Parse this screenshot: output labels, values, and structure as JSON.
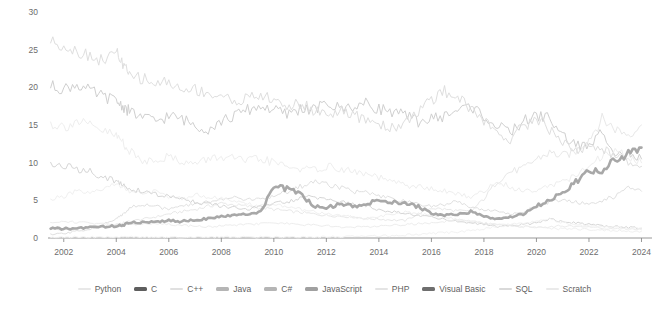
{
  "chart_data": {
    "type": "line",
    "title": "",
    "subtitle": "",
    "xlabel": "",
    "ylabel": "",
    "xlim": [
      2001.4,
      2024.4
    ],
    "ylim": [
      0,
      30
    ],
    "grid": false,
    "legend_position": "bottom",
    "highlight_series": "JavaScript",
    "x_ticks": [
      "2002",
      "2004",
      "2006",
      "2008",
      "2010",
      "2012",
      "2014",
      "2016",
      "2018",
      "2020",
      "2022",
      "2024"
    ],
    "x_tick_values": [
      2002,
      2004,
      2006,
      2008,
      2010,
      2012,
      2014,
      2016,
      2018,
      2020,
      2022,
      2024
    ],
    "y_ticks": [
      "0",
      "5",
      "10",
      "15",
      "20",
      "25",
      "30"
    ],
    "y_tick_values": [
      0,
      5,
      10,
      15,
      20,
      25,
      30
    ],
    "x": [
      2001.5,
      2002.0,
      2002.5,
      2003.0,
      2003.5,
      2004.0,
      2004.25,
      2004.5,
      2005.0,
      2005.5,
      2006.0,
      2006.5,
      2007.0,
      2007.5,
      2008.0,
      2008.5,
      2009.0,
      2009.5,
      2010.0,
      2010.5,
      2011.0,
      2011.5,
      2012.0,
      2012.5,
      2013.0,
      2013.5,
      2014.0,
      2014.5,
      2015.0,
      2015.5,
      2016.0,
      2016.5,
      2017.0,
      2017.5,
      2018.0,
      2018.5,
      2019.0,
      2019.5,
      2020.0,
      2020.5,
      2021.0,
      2021.5,
      2022.0,
      2022.5,
      2023.0,
      2023.5,
      2024.0
    ],
    "series": [
      {
        "name": "Python",
        "color": "#e8e8e8",
        "highlight": false,
        "values": [
          1.2,
          1.1,
          1.3,
          1.5,
          1.6,
          1.8,
          2.0,
          2.2,
          2.5,
          2.8,
          3.2,
          3.5,
          3.8,
          4.2,
          4.6,
          4.4,
          4.2,
          4.0,
          3.8,
          3.6,
          3.4,
          3.2,
          3.0,
          2.9,
          2.8,
          2.6,
          2.5,
          2.4,
          2.3,
          3.2,
          4.0,
          3.8,
          3.6,
          3.5,
          5.2,
          7.5,
          8.8,
          9.2,
          10.5,
          11.3,
          10.9,
          11.5,
          13.2,
          15.8,
          14.5,
          13.8,
          15.0
        ]
      },
      {
        "name": "C",
        "color": "#cfcfcf",
        "highlight": false,
        "values": [
          20.2,
          19.8,
          20.4,
          19.5,
          18.8,
          18.2,
          17.5,
          16.8,
          16.0,
          15.5,
          16.2,
          15.8,
          15.0,
          14.5,
          15.5,
          16.2,
          17.0,
          17.5,
          17.0,
          16.4,
          17.2,
          17.0,
          17.8,
          17.2,
          17.5,
          17.8,
          17.2,
          16.8,
          16.2,
          15.5,
          15.8,
          16.2,
          17.0,
          17.5,
          16.2,
          14.8,
          14.0,
          15.5,
          16.2,
          16.0,
          13.5,
          12.5,
          12.0,
          14.2,
          11.5,
          11.0,
          10.5
        ]
      },
      {
        "name": "C++",
        "color": "#eeeeee",
        "highlight": false,
        "values": [
          15.2,
          14.8,
          15.5,
          14.8,
          14.2,
          13.5,
          12.8,
          11.5,
          10.2,
          10.5,
          10.8,
          10.2,
          9.8,
          10.5,
          10.8,
          10.5,
          10.2,
          10.5,
          10.0,
          9.5,
          9.2,
          9.0,
          9.5,
          9.2,
          8.8,
          8.5,
          8.0,
          7.5,
          7.0,
          6.8,
          6.5,
          6.2,
          5.8,
          5.5,
          6.2,
          7.5,
          6.8,
          6.2,
          6.5,
          7.0,
          7.5,
          8.2,
          9.5,
          10.8,
          11.8,
          10.5,
          10.0
        ]
      },
      {
        "name": "Java",
        "color": "#dedede",
        "highlight": false,
        "values": [
          26.2,
          25.5,
          24.8,
          24.2,
          23.5,
          24.8,
          23.0,
          21.5,
          21.2,
          20.5,
          20.8,
          19.5,
          19.8,
          19.2,
          18.8,
          18.2,
          18.5,
          19.0,
          18.2,
          17.5,
          17.8,
          17.0,
          16.5,
          16.8,
          16.2,
          15.8,
          15.2,
          14.5,
          15.5,
          16.8,
          18.2,
          19.5,
          18.8,
          17.2,
          15.5,
          14.0,
          13.2,
          14.8,
          16.0,
          14.5,
          12.8,
          11.5,
          12.2,
          11.8,
          11.0,
          10.2,
          9.5
        ]
      },
      {
        "name": "C#",
        "color": "#e0e0e0",
        "highlight": false,
        "values": [
          0.4,
          0.6,
          0.9,
          1.2,
          1.8,
          2.5,
          3.2,
          4.0,
          4.5,
          4.2,
          3.8,
          4.2,
          4.5,
          4.8,
          5.2,
          5.5,
          5.0,
          5.2,
          5.5,
          6.2,
          6.8,
          7.5,
          7.2,
          6.8,
          6.2,
          6.0,
          5.5,
          5.2,
          4.8,
          4.5,
          4.2,
          4.5,
          4.8,
          4.2,
          3.8,
          3.5,
          3.2,
          3.5,
          4.2,
          4.8,
          5.2,
          4.8,
          4.5,
          5.0,
          5.5,
          6.8,
          6.2
        ]
      },
      {
        "name": "JavaScript",
        "color": "#a8a8a8",
        "highlight": true,
        "values": [
          1.3,
          1.2,
          1.3,
          1.4,
          1.5,
          1.6,
          1.7,
          2.0,
          2.1,
          2.2,
          2.3,
          2.2,
          2.4,
          2.6,
          2.8,
          3.0,
          3.2,
          3.5,
          6.8,
          6.5,
          6.0,
          4.2,
          4.0,
          4.5,
          4.2,
          4.5,
          5.0,
          4.8,
          4.5,
          4.2,
          3.2,
          3.0,
          3.2,
          3.5,
          2.8,
          2.5,
          2.8,
          3.2,
          4.2,
          5.0,
          6.0,
          7.5,
          9.0,
          8.5,
          10.5,
          11.2,
          12.0
        ]
      },
      {
        "name": "PHP",
        "color": "#f0f0f0",
        "highlight": false,
        "values": [
          5.2,
          5.5,
          6.2,
          5.8,
          6.5,
          7.2,
          6.8,
          6.2,
          5.8,
          6.2,
          5.5,
          5.2,
          5.8,
          5.5,
          5.2,
          4.8,
          4.5,
          4.2,
          4.5,
          4.2,
          3.8,
          3.5,
          3.2,
          3.0,
          2.8,
          2.5,
          2.8,
          3.2,
          3.5,
          3.2,
          3.0,
          2.8,
          2.5,
          2.2,
          2.0,
          1.8,
          1.6,
          1.5,
          1.4,
          1.3,
          1.2,
          1.2,
          1.1,
          1.0,
          1.0,
          0.9,
          0.9
        ]
      },
      {
        "name": "Visual Basic",
        "color": "#d6d6d6",
        "highlight": false,
        "values": [
          9.8,
          9.5,
          9.2,
          8.8,
          8.2,
          7.5,
          7.0,
          6.5,
          6.2,
          5.8,
          5.5,
          5.2,
          4.8,
          4.5,
          4.2,
          4.0,
          3.8,
          4.2,
          4.5,
          4.8,
          5.2,
          5.5,
          5.2,
          4.8,
          4.5,
          4.2,
          3.8,
          3.5,
          3.2,
          3.0,
          2.8,
          2.5,
          2.2,
          2.0,
          1.8,
          1.5,
          1.6,
          1.8,
          2.0,
          2.5,
          2.2,
          2.0,
          1.8,
          1.6,
          1.5,
          1.4,
          1.3
        ]
      },
      {
        "name": "SQL",
        "color": "#ededed",
        "highlight": false,
        "values": [
          2.0,
          2.2,
          2.1,
          2.0,
          1.9,
          1.8,
          1.7,
          1.8,
          1.9,
          2.0,
          1.8,
          1.7,
          1.6,
          1.5,
          1.6,
          1.7,
          1.8,
          1.9,
          2.0,
          1.9,
          1.8,
          1.7,
          1.6,
          1.5,
          1.4,
          1.5,
          1.6,
          1.7,
          1.8,
          1.9,
          2.0,
          2.2,
          2.5,
          2.2,
          2.0,
          1.8,
          1.6,
          1.5,
          1.4,
          1.5,
          1.6,
          1.5,
          1.4,
          1.3,
          1.2,
          1.2,
          1.1
        ]
      },
      {
        "name": "Scratch",
        "color": "#f2f2f2",
        "highlight": false,
        "values": [
          0.1,
          0.1,
          0.1,
          0.1,
          0.1,
          0.1,
          0.1,
          0.1,
          0.1,
          0.1,
          0.1,
          0.1,
          0.1,
          0.1,
          0.1,
          0.1,
          0.1,
          0.1,
          0.1,
          0.1,
          0.1,
          0.1,
          0.2,
          0.2,
          0.2,
          0.2,
          0.3,
          0.3,
          0.4,
          0.5,
          0.6,
          0.7,
          0.8,
          1.0,
          1.2,
          1.5,
          1.8,
          2.0,
          2.2,
          2.5,
          2.0,
          1.8,
          1.6,
          1.5,
          1.4,
          1.3,
          1.2
        ]
      }
    ]
  },
  "legend": {
    "items": [
      {
        "label": "Python",
        "color": "#e8e8e8",
        "highlight": false
      },
      {
        "label": "C",
        "color": "#5e5e5e",
        "highlight": true
      },
      {
        "label": "C++",
        "color": "#e0e0e0",
        "highlight": false
      },
      {
        "label": "Java",
        "color": "#b5b5b5",
        "highlight": true
      },
      {
        "label": "C#",
        "color": "#b5b5b5",
        "highlight": true
      },
      {
        "label": "JavaScript",
        "color": "#a0a0a0",
        "highlight": true
      },
      {
        "label": "PHP",
        "color": "#e4e4e4",
        "highlight": false
      },
      {
        "label": "Visual Basic",
        "color": "#6e6e6e",
        "highlight": true
      },
      {
        "label": "SQL",
        "color": "#d9d9d9",
        "highlight": false
      },
      {
        "label": "Scratch",
        "color": "#eaeaea",
        "highlight": false
      }
    ]
  }
}
